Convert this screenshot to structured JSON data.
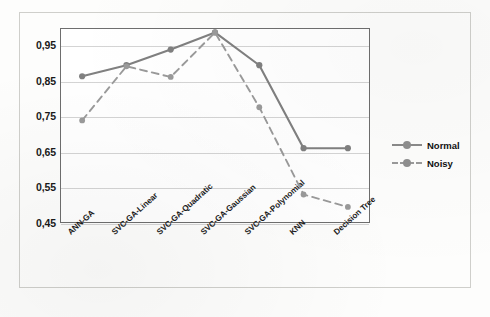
{
  "chart_data": {
    "type": "line",
    "title": "",
    "xlabel": "",
    "ylabel": "",
    "categories": [
      "ANN-GA",
      "SVC-GA-Linear",
      "SVC-GA-Quadratic",
      "SVC-GA-Gaussian",
      "SVC-GA-Polynomial",
      "KNN",
      "Decision Tree"
    ],
    "series": [
      {
        "name": "Normal",
        "style": "solid",
        "color": "#808080",
        "marker": "circle",
        "values": [
          0.862,
          0.893,
          0.937,
          0.985,
          0.893,
          0.66,
          0.66
        ]
      },
      {
        "name": "Noisy",
        "style": "dashed",
        "color": "#9a9a9a",
        "marker": "circle",
        "values": [
          0.738,
          0.89,
          0.86,
          0.985,
          0.775,
          0.53,
          0.495
        ]
      }
    ],
    "ylim": [
      0.45,
      0.9975
    ],
    "yticks": [
      0.95,
      0.85,
      0.75,
      0.65,
      0.55,
      0.45
    ],
    "ytick_labels": [
      "0,95",
      "0,85",
      "0,75",
      "0,65",
      "0,55",
      "0,45"
    ],
    "grid": true,
    "legend_position": "right"
  },
  "legend": {
    "entries": [
      {
        "label": "Normal"
      },
      {
        "label": "Noisy"
      }
    ]
  },
  "colors": {
    "normal_series": "#808080",
    "noisy_series": "#9a9a9a",
    "gridline": "#d4d4d4",
    "plot_border": "#6e6e6e",
    "figure_border": "#cfcfcb",
    "text": "#1a1a1a"
  }
}
